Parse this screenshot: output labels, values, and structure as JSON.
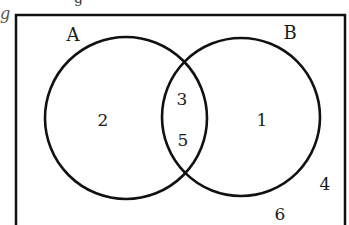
{
  "diagram": {
    "type": "venn",
    "universal_set": {
      "border": "rectangle",
      "border_sides_visible": [
        "top",
        "left",
        "right"
      ]
    },
    "sets": [
      {
        "name": "A",
        "label": "A"
      },
      {
        "name": "B",
        "label": "B"
      }
    ],
    "regions": {
      "a_only": "2",
      "a_and_b_top": "3",
      "a_and_b_bottom": "5",
      "b_only": "1",
      "outside_1": "4",
      "outside_2": "6"
    },
    "cropped_text": {
      "left_margin_glyph": "g",
      "top_glyph": "g"
    },
    "colors": {
      "stroke": "#111111",
      "text": "#1a1a1a",
      "background": "#ffffff"
    }
  }
}
